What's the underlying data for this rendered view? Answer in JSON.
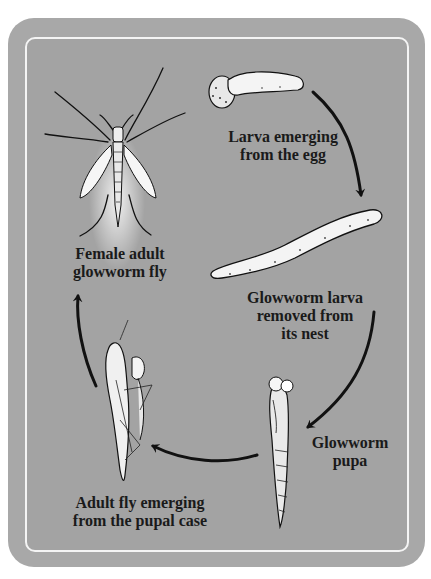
{
  "diagram": {
    "type": "life-cycle",
    "subject": "Glowworm",
    "stages": [
      {
        "id": "larva-hatching",
        "label": "Larva emerging\nfrom the egg"
      },
      {
        "id": "larva",
        "label": "Glowworm larva\nremoved from\nits nest"
      },
      {
        "id": "pupa",
        "label": "Glowworm\npupa"
      },
      {
        "id": "emerging-adult",
        "label": "Adult fly emerging\nfrom the pupal case"
      },
      {
        "id": "adult",
        "label": "Female adult\nglowworm fly"
      }
    ],
    "flow": [
      {
        "from": "larva-hatching",
        "to": "larva"
      },
      {
        "from": "larva",
        "to": "pupa"
      },
      {
        "from": "pupa",
        "to": "emerging-adult"
      },
      {
        "from": "emerging-adult",
        "to": "adult"
      }
    ],
    "colors": {
      "frame": "#a8a8a8",
      "panel": "#a3a3a3",
      "panel_border": "#f4f4f4",
      "illustration_fill": "#f2f2f2",
      "ink": "#1a1a1a"
    }
  }
}
